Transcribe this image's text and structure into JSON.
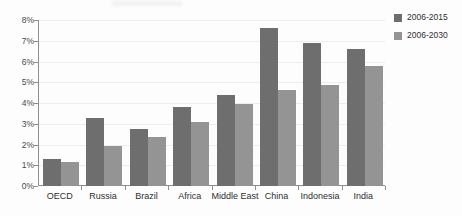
{
  "chart_data": {
    "type": "bar",
    "title": "",
    "subtitle": "",
    "xlabel": "",
    "ylabel": "",
    "ylim": [
      0,
      8
    ],
    "ytick_values": [
      0,
      1,
      2,
      3,
      4,
      5,
      6,
      7,
      8
    ],
    "ytick_labels": [
      "0%",
      "1%",
      "2%",
      "3%",
      "4%",
      "5%",
      "6%",
      "7%",
      "8%"
    ],
    "grid": true,
    "grid_axis": "y",
    "legend_position": "right",
    "categories": [
      "OECD",
      "Russia",
      "Brazil",
      "Africa",
      "Middle East",
      "China",
      "Indonesia",
      "India"
    ],
    "series": [
      {
        "name": "2006-2015",
        "color": "#6e6e6e",
        "values": [
          1.3,
          3.3,
          2.75,
          3.8,
          4.4,
          7.6,
          6.9,
          6.6
        ]
      },
      {
        "name": "2006-2030",
        "color": "#949494",
        "values": [
          1.15,
          1.95,
          2.35,
          3.1,
          3.95,
          4.65,
          4.85,
          5.8
        ]
      }
    ],
    "annotations": []
  },
  "legend": {
    "items": [
      {
        "label": "2006-2015",
        "color": "#6e6e6e"
      },
      {
        "label": "2006-2030",
        "color": "#949494"
      }
    ]
  },
  "axes": {
    "y": {
      "labels": [
        "8%",
        "7%",
        "6%",
        "5%",
        "4%",
        "3%",
        "2%",
        "1%",
        "0%"
      ]
    },
    "x": {
      "labels": [
        "OECD",
        "Russia",
        "Brazil",
        "Africa",
        "Middle East",
        "China",
        "Indonesia",
        "India"
      ]
    }
  },
  "colors": {
    "series_dark": "#6e6e6e",
    "series_light": "#949494",
    "axis": "#8e8e8e",
    "grid": "#ededed",
    "background": "#fdfdfd",
    "text": "#2f2f2f"
  }
}
